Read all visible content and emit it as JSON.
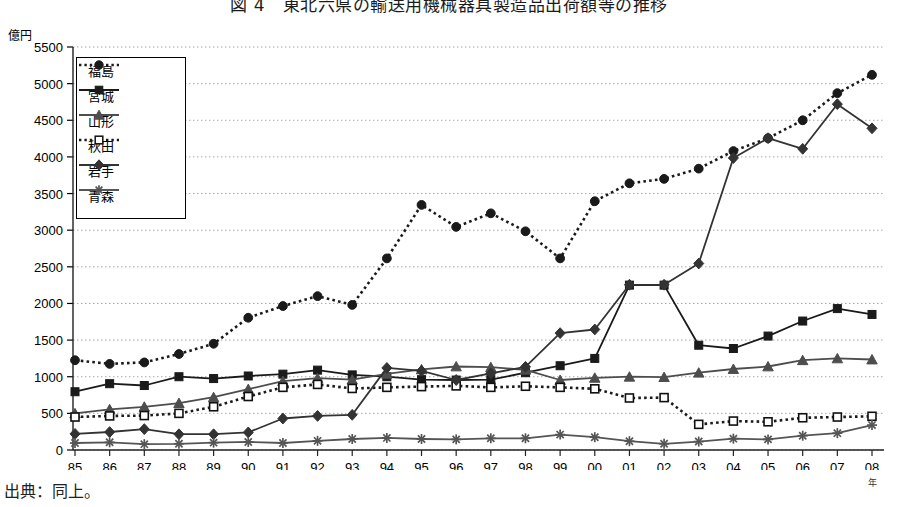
{
  "title": "図 4　東北六県の輸送用機械器具製造品出荷額等の推移",
  "footer": "出典：同上。",
  "axis": {
    "y_unit": "億円",
    "x_unit": "年",
    "y_ticks": [
      0,
      500,
      1000,
      1500,
      2000,
      2500,
      3000,
      3500,
      4000,
      4500,
      5000,
      5500
    ],
    "ylim": [
      0,
      5500
    ],
    "x_labels": [
      "85",
      "86",
      "87",
      "88",
      "89",
      "90",
      "91",
      "92",
      "93",
      "94",
      "95",
      "96",
      "97",
      "98",
      "99",
      "00",
      "01",
      "02",
      "03",
      "04",
      "05",
      "06",
      "07",
      "08"
    ]
  },
  "legend": {
    "items": [
      {
        "label": "福島",
        "marker": "circle",
        "line": "dotted",
        "color": "#1a1a1a"
      },
      {
        "label": "宮城",
        "marker": "square",
        "line": "solid",
        "color": "#1a1a1a"
      },
      {
        "label": "山形",
        "marker": "triangle",
        "line": "solid",
        "color": "#4d4d4d"
      },
      {
        "label": "秋田",
        "marker": "open-square",
        "line": "dotted",
        "color": "#1a1a1a"
      },
      {
        "label": "岩手",
        "marker": "diamond",
        "line": "solid",
        "color": "#333333"
      },
      {
        "label": "青森",
        "marker": "star",
        "line": "solid",
        "color": "#555555"
      }
    ]
  },
  "chart_data": {
    "type": "line",
    "title": "図 4　東北六県の輸送用機械器具製造品出荷額等の推移",
    "xlabel": "年",
    "ylabel": "億円",
    "ylim": [
      0,
      5500
    ],
    "grid": true,
    "legend_position": "upper-left-inset",
    "x": [
      "85",
      "86",
      "87",
      "88",
      "89",
      "90",
      "91",
      "92",
      "93",
      "94",
      "95",
      "96",
      "97",
      "98",
      "99",
      "00",
      "01",
      "02",
      "03",
      "04",
      "05",
      "06",
      "07",
      "08"
    ],
    "series": [
      {
        "name": "福島",
        "marker": "circle",
        "line": "dotted",
        "values": [
          1225,
          1175,
          1195,
          1310,
          1450,
          1805,
          1965,
          2100,
          1980,
          2615,
          3345,
          3045,
          3230,
          2985,
          2615,
          3395,
          3640,
          3700,
          3840,
          4080,
          4255,
          4500,
          4870,
          5120
        ]
      },
      {
        "name": "宮城",
        "marker": "square",
        "line": "solid",
        "values": [
          795,
          905,
          880,
          1000,
          975,
          1010,
          1035,
          1090,
          1025,
          1000,
          960,
          955,
          960,
          1055,
          1150,
          1250,
          2250,
          2250,
          1430,
          1385,
          1555,
          1760,
          1930,
          1850
        ]
      },
      {
        "name": "山形",
        "marker": "triangle",
        "line": "solid",
        "values": [
          500,
          555,
          590,
          640,
          720,
          830,
          940,
          980,
          960,
          1040,
          1100,
          1140,
          1130,
          1095,
          955,
          985,
          1000,
          995,
          1055,
          1105,
          1140,
          1225,
          1250,
          1235
        ]
      },
      {
        "name": "秋田",
        "marker": "open-square",
        "line": "dotted",
        "values": [
          450,
          465,
          470,
          500,
          590,
          730,
          855,
          895,
          840,
          855,
          865,
          875,
          855,
          870,
          855,
          835,
          710,
          715,
          350,
          395,
          385,
          440,
          450,
          460
        ]
      },
      {
        "name": "岩手",
        "marker": "diamond",
        "line": "solid",
        "values": [
          220,
          245,
          285,
          215,
          215,
          240,
          430,
          465,
          480,
          1120,
          1080,
          955,
          1045,
          1135,
          1595,
          1645,
          2255,
          2255,
          2545,
          3985,
          4255,
          4110,
          4720,
          4390
        ]
      },
      {
        "name": "青森",
        "marker": "star",
        "line": "solid",
        "values": [
          95,
          105,
          80,
          85,
          100,
          110,
          95,
          125,
          150,
          165,
          150,
          145,
          160,
          160,
          210,
          175,
          120,
          85,
          115,
          155,
          145,
          195,
          230,
          340
        ]
      }
    ]
  }
}
